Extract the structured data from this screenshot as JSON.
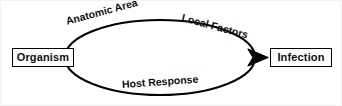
{
  "figure": {
    "type": "cycle-flow-diagram",
    "background_color": "#ffffff",
    "stroke_color": "#000000",
    "text_color": "#111111"
  },
  "nodes": [
    {
      "id": "organism",
      "label": "Organism"
    },
    {
      "id": "infection",
      "label": "Infection"
    }
  ],
  "edge_labels": [
    {
      "id": "anatomic-area",
      "label": "Anatomic Area"
    },
    {
      "id": "local-factors",
      "label": "Local Factors"
    },
    {
      "id": "host-response",
      "label": "Host Response"
    }
  ]
}
